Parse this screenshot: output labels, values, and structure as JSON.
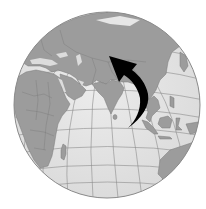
{
  "map": {
    "type": "orthographic-globe",
    "view_center": "Indian Ocean / South Asia",
    "colors": {
      "background": "#ffffff",
      "ocean": "#e2e2e2",
      "land": "#9c9c9c",
      "land_border": "#7a7a7a",
      "graticule": "#8c8c8c",
      "globe_outline": "#8a8a8a",
      "arrow": "#000000"
    },
    "visible_regions": [
      "Europe",
      "Africa",
      "Middle East",
      "Russia",
      "Central Asia",
      "India",
      "Sri Lanka",
      "China",
      "Southeast Asia",
      "Indonesia",
      "Madagascar",
      "Australia",
      "Indian Ocean"
    ],
    "annotation": {
      "type": "curved-arrow",
      "description": "Black curved arrow sweeping from the Indian Ocean near Southeast Asia north-westward to Central Asia",
      "from": "Indian Ocean (south of Bay of Bengal)",
      "to": "Central Asia (north of the Himalayas)"
    }
  }
}
